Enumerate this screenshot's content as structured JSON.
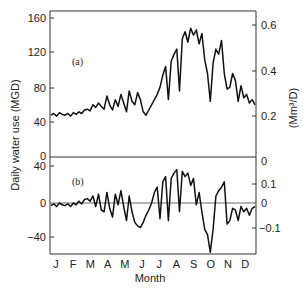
{
  "chart_data": [
    {
      "type": "line",
      "panel": "(a)",
      "title": "",
      "xlabel": "Month",
      "ylabel": "Daily water use (MGD)",
      "ylabel_right": "(Mm3/D)",
      "categories": [
        "J",
        "F",
        "M",
        "A",
        "M",
        "J",
        "J",
        "A",
        "S",
        "O",
        "N",
        "D"
      ],
      "yticks": [
        0,
        40,
        80,
        120,
        160
      ],
      "yticks_right": [
        0.2,
        0.4,
        0.6
      ],
      "ylim": [
        0,
        170
      ],
      "grid": false,
      "series": [
        {
          "name": "Daily water use",
          "x_day": [
            0,
            5,
            10,
            15,
            20,
            25,
            30,
            35,
            40,
            45,
            50,
            55,
            60,
            65,
            70,
            75,
            80,
            85,
            90,
            95,
            100,
            105,
            110,
            115,
            120,
            125,
            130,
            135,
            140,
            145,
            150,
            155,
            160,
            165,
            170,
            175,
            180,
            185,
            190,
            195,
            200,
            205,
            210,
            215,
            220,
            225,
            230,
            235,
            240,
            245,
            250,
            255,
            260,
            265,
            270,
            275,
            280,
            285,
            290,
            295,
            300,
            305,
            310,
            315,
            320,
            325,
            330,
            335,
            340,
            345,
            350,
            355,
            360,
            365
          ],
          "values": [
            48,
            50,
            47,
            51,
            49,
            48,
            50,
            47,
            51,
            49,
            52,
            50,
            54,
            55,
            53,
            60,
            57,
            62,
            58,
            55,
            70,
            60,
            54,
            66,
            58,
            72,
            62,
            52,
            76,
            64,
            60,
            74,
            66,
            52,
            48,
            54,
            60,
            66,
            72,
            80,
            94,
            104,
            66,
            110,
            118,
            124,
            76,
            136,
            144,
            132,
            148,
            140,
            146,
            130,
            142,
            112,
            96,
            64,
            108,
            124,
            118,
            134,
            96,
            78,
            80,
            96,
            88,
            64,
            82,
            68,
            72,
            62,
            66,
            60
          ],
          "color": "#111111"
        }
      ]
    },
    {
      "type": "line",
      "panel": "(b)",
      "title": "",
      "xlabel": "Month",
      "ylabel": "Daily water use (MGD)",
      "ylabel_right": "(Mm3/D)",
      "categories": [
        "J",
        "F",
        "M",
        "A",
        "M",
        "J",
        "J",
        "A",
        "S",
        "O",
        "N",
        "D"
      ],
      "yticks": [
        -40,
        0,
        40
      ],
      "yticks_right": [
        -0.1,
        0,
        0.1
      ],
      "ylim": [
        -60,
        44
      ],
      "grid": false,
      "zero_line": true,
      "series": [
        {
          "name": "Deviation from mean",
          "x_day": [
            0,
            5,
            10,
            15,
            20,
            25,
            30,
            35,
            40,
            45,
            50,
            55,
            60,
            65,
            70,
            75,
            80,
            85,
            90,
            95,
            100,
            105,
            110,
            115,
            120,
            125,
            130,
            135,
            140,
            145,
            150,
            155,
            160,
            165,
            170,
            175,
            180,
            185,
            190,
            195,
            200,
            205,
            210,
            215,
            220,
            225,
            230,
            235,
            240,
            245,
            250,
            255,
            260,
            265,
            270,
            275,
            280,
            285,
            290,
            295,
            300,
            305,
            310,
            315,
            320,
            325,
            330,
            335,
            340,
            345,
            350,
            355,
            360,
            365
          ],
          "values": [
            -3,
            -1,
            -4,
            0,
            -2,
            -3,
            -1,
            -4,
            0,
            -2,
            2,
            -1,
            4,
            5,
            2,
            8,
            -4,
            10,
            -8,
            -10,
            12,
            -6,
            -16,
            10,
            -2,
            14,
            -4,
            -20,
            8,
            -10,
            -22,
            -26,
            -28,
            -22,
            -14,
            -8,
            0,
            12,
            18,
            -18,
            24,
            30,
            -20,
            28,
            34,
            38,
            -10,
            36,
            30,
            34,
            20,
            28,
            -2,
            12,
            -10,
            -30,
            -36,
            -56,
            -30,
            8,
            14,
            18,
            24,
            -24,
            -20,
            -6,
            -8,
            -20,
            -4,
            -10,
            -6,
            -14,
            -6,
            -4
          ],
          "color": "#111111"
        }
      ]
    }
  ],
  "axes": {
    "ylabel_left": "Daily water use (MGD)",
    "ylabel_right": "(Mm³/D)",
    "xlabel": "Month",
    "months": [
      "J",
      "F",
      "M",
      "A",
      "M",
      "J",
      "J",
      "A",
      "S",
      "O",
      "N",
      "D"
    ],
    "panel_a": {
      "label": "(a)",
      "left_ticks": [
        "160",
        "120",
        "80",
        "40",
        "0"
      ],
      "right_ticks": [
        "0.6",
        "0.4",
        "0.2"
      ]
    },
    "panel_b": {
      "label": "(b)",
      "left_ticks": [
        "40",
        "0",
        "−40"
      ],
      "right_ticks": [
        "0",
        "0.1",
        "0",
        "−0.1"
      ]
    }
  }
}
